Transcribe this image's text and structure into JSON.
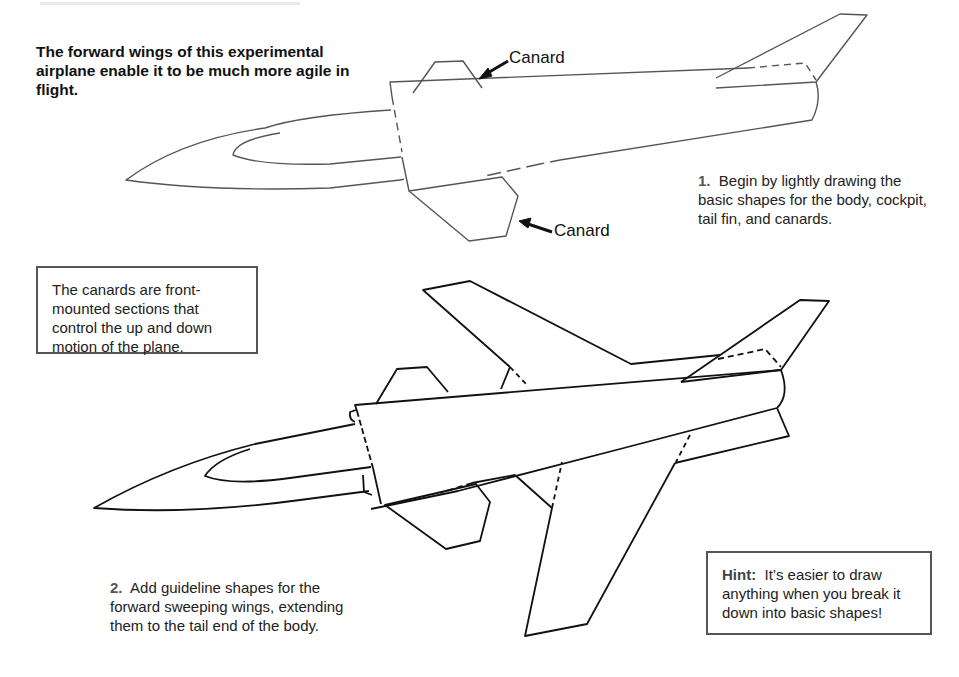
{
  "intro": {
    "text": "The forward wings of this experimental airplane enable it to be much more agile in flight."
  },
  "callouts": {
    "canard_top": "Canard",
    "canard_bottom": "Canard"
  },
  "steps": [
    {
      "number": "1.",
      "text": "Begin by lightly drawing the basic shapes for the body, cockpit, tail fin, and canards."
    },
    {
      "number": "2.",
      "text": "Add guideline shapes for the forward sweeping wings, extending them to the tail end of the body."
    }
  ],
  "info_box": {
    "text": "The canards are front-mounted sections that control the up and down motion of the plane."
  },
  "hint_box": {
    "label": "Hint:",
    "text": "It’s easier to draw anything when you break it down into basic shapes!"
  },
  "colors": {
    "line_light": "#555555",
    "line_dark": "#111111",
    "box_border": "#555555",
    "background": "#ffffff"
  }
}
